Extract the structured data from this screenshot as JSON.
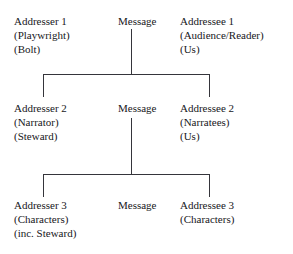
{
  "diagram": {
    "type": "three-tier-communication-model",
    "levels": [
      {
        "id": "level-1",
        "addresser": {
          "title": "Addresser 1",
          "role": "(Playwright)",
          "instance": "(Bolt)"
        },
        "message": "Message",
        "addressee": {
          "title": "Addressee 1",
          "role": "(Audience/Reader)",
          "instance": "(Us)"
        }
      },
      {
        "id": "level-2",
        "addresser": {
          "title": "Addresser 2",
          "role": "(Narrator)",
          "instance": "(Steward)"
        },
        "message": "Message",
        "addressee": {
          "title": "Addressee 2",
          "role": "(Narratees)",
          "instance": "(Us)"
        }
      },
      {
        "id": "level-3",
        "addresser": {
          "title": "Addresser 3",
          "role": "(Characters)",
          "instance": "(inc. Steward)"
        },
        "message": "Message",
        "addressee": {
          "title": "Addressee 3",
          "role": "(Characters)",
          "instance": ""
        }
      }
    ],
    "connectors": [
      {
        "id": "bracket-1",
        "from": "message-1",
        "to": "level-2"
      },
      {
        "id": "bracket-2",
        "from": "message-2",
        "to": "level-3"
      }
    ],
    "colors": {
      "text": "#17171b",
      "line": "#35353b",
      "background": "#ffffff"
    }
  }
}
